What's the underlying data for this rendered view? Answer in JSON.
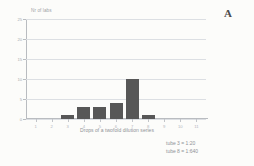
{
  "panel": {
    "letter": "A"
  },
  "chart_data": {
    "type": "bar",
    "title": "",
    "xlabel": "Drops of a twofold dilution series",
    "ylabel": "Nr of labs",
    "categories": [
      "1",
      "2",
      "3",
      "4",
      "5",
      "6",
      "7",
      "8",
      "9",
      "10",
      "11"
    ],
    "values": [
      0,
      0,
      1,
      3,
      3,
      4,
      10,
      1,
      0,
      0,
      0
    ],
    "ylim": [
      0,
      25
    ],
    "yticks": [
      0,
      5,
      10,
      15,
      20,
      25
    ],
    "ytick_labels": [
      "0",
      "5",
      "10",
      "15",
      "20",
      "25"
    ],
    "xlim": [
      0.4,
      11.6
    ],
    "grid": true,
    "legend": "none",
    "bar_color": "#575757",
    "grid_color": "#dcdfe3",
    "axis_color": "#b9bcc0",
    "annotations": [
      "tube 3 = 1:20",
      "tube 8 = 1:640"
    ]
  }
}
